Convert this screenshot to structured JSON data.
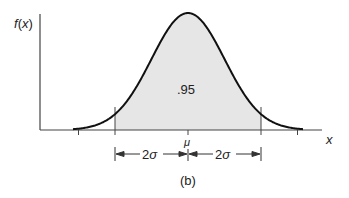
{
  "figure": {
    "y_axis_label": "f(x)",
    "x_axis_label": "x",
    "area_label": ".95",
    "mean_label": "μ",
    "left_span_label": "2σ",
    "right_span_label": "2σ",
    "caption": "(b)"
  },
  "colors": {
    "curve": "#111111",
    "axis": "#444444",
    "shade": "#e6e6e6"
  },
  "geometry": {
    "mu_px": 188,
    "sigma_px": 36.5,
    "baseline_y": 130,
    "peak_y": 13,
    "axis_x0": 40,
    "axis_x1": 322,
    "curve_x0": 73,
    "curve_x1": 303
  }
}
